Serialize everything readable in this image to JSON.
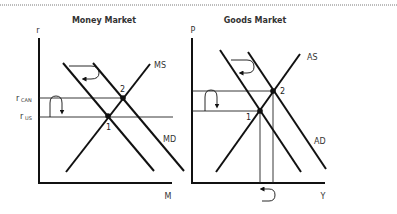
{
  "diagram": {
    "money_market": {
      "title": "Money Market",
      "y_axis_label": "r",
      "x_axis_label": "M",
      "curves": {
        "supply": "MS",
        "demand": "MD"
      },
      "rates": {
        "r_can_main": "r",
        "r_can_sub": "CAN",
        "r_us_main": "r",
        "r_us_sub": "US"
      },
      "points": {
        "p1": "1",
        "p2": "2"
      }
    },
    "goods_market": {
      "title": "Goods Market",
      "y_axis_label": "P",
      "x_axis_label": "Y",
      "curves": {
        "supply": "AS",
        "demand": "AD"
      },
      "points": {
        "p1": "1",
        "p2": "2"
      }
    }
  }
}
